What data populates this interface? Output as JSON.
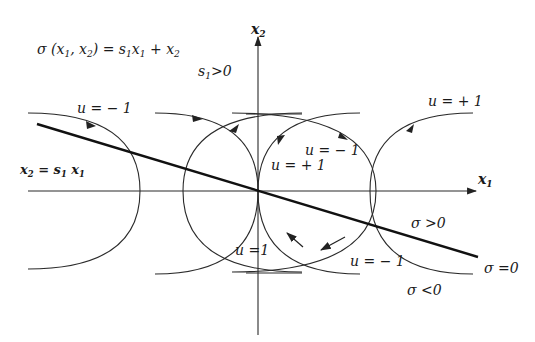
{
  "diagram": {
    "colors": {
      "line": "#2a2a2a",
      "switching_line": "#111111",
      "background": "#ffffff"
    },
    "axes": {
      "x_label": "x",
      "x_label_sub": "1",
      "y_label": "x",
      "y_label_sub": "2"
    },
    "equations": {
      "sigma_def_lhs": "σ (x",
      "sigma_def_mid1": "1",
      "sigma_def_mid2": ", x",
      "sigma_def_mid3": "2",
      "sigma_def_mid4": ") = s",
      "sigma_def_mid5": "1",
      "sigma_def_mid6": "x",
      "sigma_def_mid7": "1",
      "sigma_def_mid8": " + x",
      "sigma_def_mid9": "2",
      "s1_condition": "s",
      "s1_condition_sub": "1",
      "s1_condition_rest": ">0",
      "switch_line_lhs": "x",
      "switch_line_lhs_sub": "2",
      "switch_line_mid": " = s",
      "switch_line_mid_sub": "1",
      "switch_line_rhs": " x",
      "switch_line_rhs_sub": "1"
    },
    "labels": {
      "u_minus_top_left": "u = − 1",
      "u_plus_top_right": "u = + 1",
      "u_minus_center": "u = − 1",
      "u_plus_center": "u = + 1",
      "u_one_bottom": "u =1",
      "u_minus_bottom": "u = − 1",
      "sigma_pos": "σ >0",
      "sigma_zero": "σ =0",
      "sigma_neg": "σ <0"
    }
  }
}
